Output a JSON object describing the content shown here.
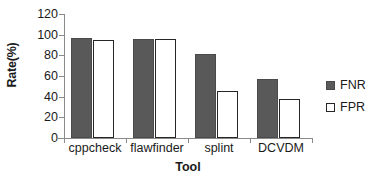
{
  "chart_data": {
    "type": "bar",
    "title": "",
    "xlabel": "Tool",
    "ylabel": "Rate(%)",
    "categories": [
      "cppcheck",
      "flawfinder",
      "splint",
      "DCVDM"
    ],
    "series": [
      {
        "name": "FNR",
        "values": [
          97,
          96,
          81,
          57
        ],
        "color": "#595959",
        "style": "filled"
      },
      {
        "name": "FPR",
        "values": [
          95,
          95.5,
          45.5,
          38
        ],
        "color": "#ffffff",
        "style": "outlined"
      }
    ],
    "ylim": [
      0,
      120
    ],
    "yticks": [
      0,
      20,
      40,
      60,
      80,
      100,
      120
    ],
    "ytick_labels": [
      "0",
      "20",
      "40",
      "60",
      "80",
      "100",
      "120"
    ],
    "grid": false,
    "legend_position": "right",
    "legend_entries": [
      "FNR",
      "FPR"
    ]
  },
  "axes": {
    "y_title": "Rate(%)",
    "x_title": "Tool"
  },
  "colors": {
    "fnr_fill": "#595959",
    "fpr_fill": "#ffffff",
    "axis": "#8a8a8a",
    "text": "#1a1a1a",
    "background": "#ffffff"
  }
}
